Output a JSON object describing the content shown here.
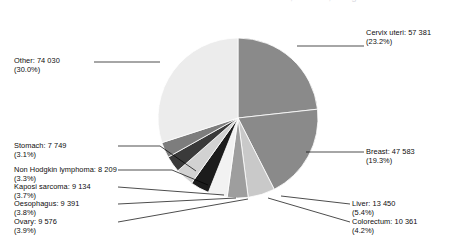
{
  "title_clipped": "Estimated cancer incidence in Eastern Africa, females, all ages",
  "chart_data": {
    "type": "pie",
    "title": "Estimated cancer incidence in Eastern Africa, females, all ages",
    "total": 246864,
    "start_angle_deg": 0,
    "direction": "clockwise",
    "legend": "labels-with-leader-lines",
    "categories": [
      "Cervix uteri",
      "Breast",
      "Liver",
      "Colorectum",
      "Ovary",
      "Oesophagus",
      "Kaposi sarcoma",
      "Non Hodgkin lymphoma",
      "Stomach",
      "Other"
    ],
    "values": [
      57381,
      47583,
      13450,
      10361,
      9576,
      9391,
      9134,
      8209,
      7749,
      74030
    ],
    "percents": [
      23.2,
      19.3,
      5.4,
      4.2,
      3.9,
      3.8,
      3.7,
      3.3,
      3.1,
      30.0
    ],
    "colors": [
      "#8a8a8a",
      "#8a8a8a",
      "#c9c9c9",
      "#9e9e9e",
      "#f2f2f2",
      "#1c1c1c",
      "#d2d2d2",
      "#3a3a3a",
      "#7d7d7d",
      "#ececec"
    ]
  },
  "slices": [
    {
      "name": "Cervix uteri",
      "value": "57 381",
      "percent": "(23.2%)",
      "label": "Cervix uteri: 57 381",
      "color": "#8a8a8a"
    },
    {
      "name": "Breast",
      "value": "47 583",
      "percent": "(19.3%)",
      "label": "Breast: 47 583",
      "color": "#8a8a8a"
    },
    {
      "name": "Liver",
      "value": "13 450",
      "percent": "(5.4%)",
      "label": "Liver: 13 450",
      "color": "#c9c9c9"
    },
    {
      "name": "Colorectum",
      "value": "10 361",
      "percent": "(4.2%)",
      "label": "Colorectum: 10 361",
      "color": "#9e9e9e"
    },
    {
      "name": "Ovary",
      "value": "9 576",
      "percent": "(3.9%)",
      "label": "Ovary: 9 576",
      "color": "#f2f2f2"
    },
    {
      "name": "Oesophagus",
      "value": "9 391",
      "percent": "(3.8%)",
      "label": "Oesophagus: 9 391",
      "color": "#1c1c1c"
    },
    {
      "name": "Kaposi sarcoma",
      "value": "9 134",
      "percent": "(3.7%)",
      "label": "Kaposi sarcoma: 9 134",
      "color": "#d2d2d2"
    },
    {
      "name": "Non Hodgkin lymphoma",
      "value": "8 209",
      "percent": "(3.3%)",
      "label": "Non Hodgkin lymphoma: 8 209",
      "color": "#3a3a3a"
    },
    {
      "name": "Stomach",
      "value": "7 749",
      "percent": "(3.1%)",
      "label": "Stomach: 7 749",
      "color": "#7d7d7d"
    },
    {
      "name": "Other",
      "value": "74 030",
      "percent": "(30.0%)",
      "label": "Other: 74 030",
      "color": "#ececec"
    }
  ]
}
